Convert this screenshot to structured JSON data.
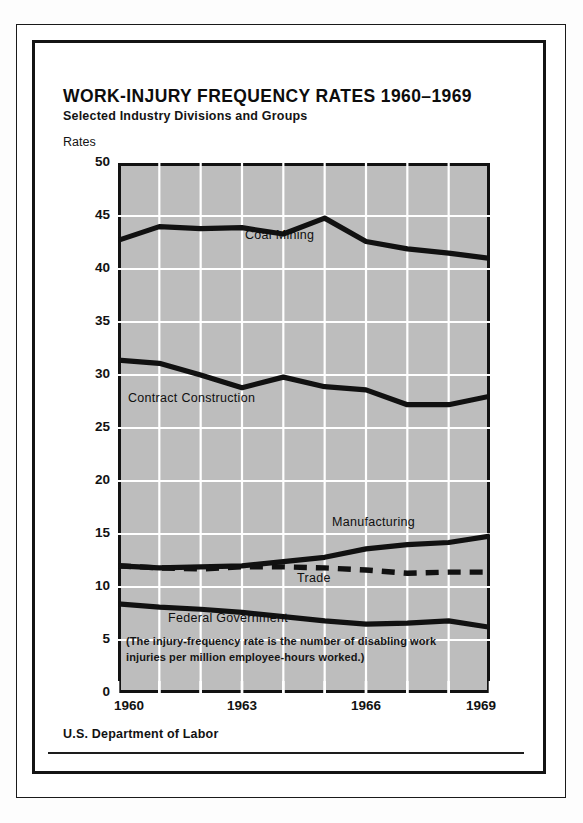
{
  "header": {
    "title": "WORK-INJURY FREQUENCY RATES 1960–1969",
    "subtitle": "Selected Industry Divisions and Groups",
    "axis_unit_label": "Rates"
  },
  "note": {
    "line1": "(The injury-frequency rate is the number of disabling work",
    "line2": "injuries per million employee-hours worked.)"
  },
  "footer": {
    "agency": "U.S. Department of Labor"
  },
  "series_labels": {
    "coal_mining": "Coal Mining",
    "contract_construction": "Contract Construction",
    "manufacturing": "Manufacturing",
    "trade": "Trade",
    "federal_government": "Federal Government"
  },
  "colors": {
    "plot_background": "#bdbdbd",
    "gridline": "#ffffff",
    "line": "#111111",
    "frame": "#141414",
    "text": "#121212"
  },
  "chart_data": {
    "type": "line",
    "title": "WORK-INJURY FREQUENCY RATES 1960–1969",
    "subtitle": "Selected Industry Divisions and Groups",
    "xlabel": "",
    "ylabel": "Rates",
    "x": [
      1960,
      1961,
      1962,
      1963,
      1964,
      1965,
      1966,
      1967,
      1968,
      1969
    ],
    "xlim": [
      1960,
      1969
    ],
    "ylim": [
      0,
      50
    ],
    "xticks": [
      1960,
      1963,
      1966,
      1969
    ],
    "xtick_labels": [
      "1960",
      "1963",
      "1966",
      "1969"
    ],
    "yticks": [
      0,
      5,
      10,
      15,
      20,
      25,
      30,
      35,
      40,
      45,
      50
    ],
    "ytick_labels": [
      "0",
      "5",
      "10",
      "15",
      "20",
      "25",
      "30",
      "35",
      "40",
      "45",
      "50"
    ],
    "grid": "both, white lines on gray panel",
    "legend": "inline labels placed on plot",
    "series": [
      {
        "name": "Coal Mining",
        "style": "solid",
        "values": [
          42.7,
          44.0,
          43.8,
          43.9,
          43.3,
          44.8,
          42.6,
          41.9,
          41.5,
          41.0
        ]
      },
      {
        "name": "Contract Construction",
        "style": "solid",
        "values": [
          31.4,
          31.1,
          30.0,
          28.8,
          29.8,
          28.9,
          28.6,
          27.2,
          27.2,
          28.0
        ]
      },
      {
        "name": "Manufacturing",
        "style": "solid",
        "values": [
          12.0,
          11.8,
          11.9,
          12.0,
          12.4,
          12.8,
          13.6,
          14.0,
          14.2,
          14.8
        ]
      },
      {
        "name": "Trade",
        "style": "dashed",
        "values": [
          12.0,
          11.8,
          11.7,
          11.9,
          11.9,
          11.8,
          11.6,
          11.3,
          11.4,
          11.4
        ]
      },
      {
        "name": "Federal Government",
        "style": "solid",
        "values": [
          8.4,
          8.1,
          7.9,
          7.6,
          7.2,
          6.8,
          6.5,
          6.6,
          6.8,
          6.2
        ]
      }
    ],
    "annotation": "(The injury-frequency rate is the number of disabling work injuries per million employee-hours worked.)",
    "source": "U.S. Department of Labor"
  }
}
